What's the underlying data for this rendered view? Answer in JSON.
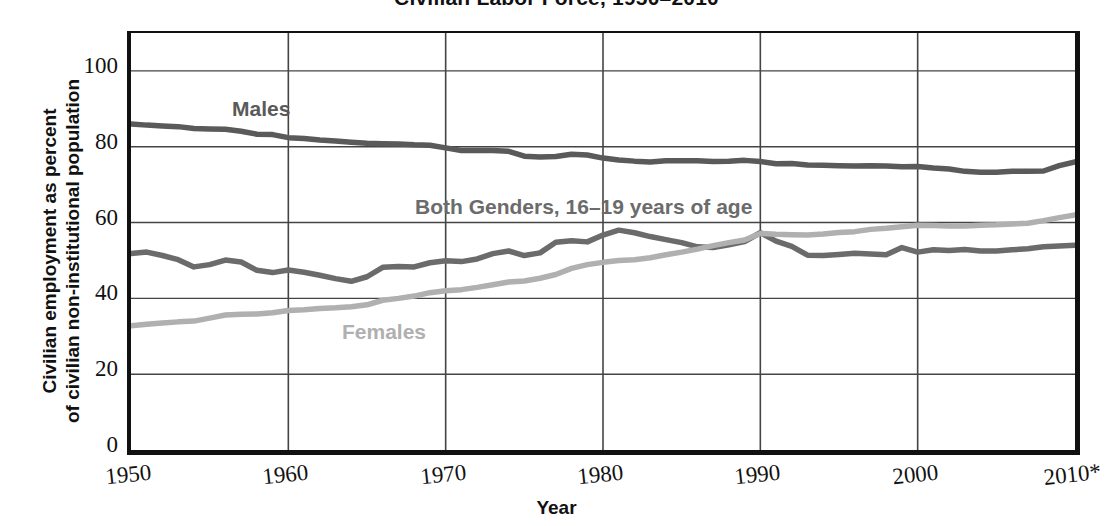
{
  "chart_data": {
    "type": "line",
    "title": "Civilian Labor Force, 1950–2010",
    "xlabel": "Year",
    "ylabel_line1": "Civilian employment as percent",
    "ylabel_line2": "of civilian non-institutional population",
    "xlim": [
      1950,
      2010
    ],
    "ylim": [
      0,
      110
    ],
    "yticks": [
      0,
      20,
      40,
      60,
      80,
      100
    ],
    "ytick_labels": [
      "0",
      "20",
      "40",
      "60",
      "80",
      "100"
    ],
    "xticks": [
      1950,
      1960,
      1970,
      1980,
      1990,
      2000,
      2010
    ],
    "xtick_labels": [
      "1950",
      "1960",
      "1970",
      "1980",
      "1990",
      "2000",
      "2010*"
    ],
    "grid": "both",
    "legend_position": "inline-annotations",
    "colors": {
      "males": "#5a5a5a",
      "both_genders_16_19": "#6b6b6b",
      "females": "#b0b0b0",
      "axis": "#111111",
      "gridline": "#444444",
      "background": "#ffffff"
    },
    "annotations": [
      {
        "text": "Males",
        "series": "Males"
      },
      {
        "text": "Both Genders, 16–19 years of age",
        "series": "Both Genders, 16-19 years of age"
      },
      {
        "text": "Females",
        "series": "Females"
      }
    ],
    "footnote_marker": "*",
    "x": [
      1950,
      1951,
      1952,
      1953,
      1954,
      1955,
      1956,
      1957,
      1958,
      1959,
      1960,
      1961,
      1962,
      1963,
      1964,
      1965,
      1966,
      1967,
      1968,
      1969,
      1970,
      1971,
      1972,
      1973,
      1974,
      1975,
      1976,
      1977,
      1978,
      1979,
      1980,
      1981,
      1982,
      1983,
      1984,
      1985,
      1986,
      1987,
      1988,
      1989,
      1990,
      1991,
      1992,
      1993,
      1994,
      1995,
      1996,
      1997,
      1998,
      1999,
      2000,
      2001,
      2002,
      2003,
      2004,
      2005,
      2006,
      2007,
      2008,
      2009,
      2010
    ],
    "series": [
      {
        "name": "Males",
        "label": "Males",
        "color": "#5a5a5a",
        "values": [
          86.0,
          85.7,
          85.5,
          85.3,
          84.8,
          84.7,
          84.6,
          84.1,
          83.3,
          83.2,
          82.4,
          82.2,
          81.8,
          81.5,
          81.2,
          80.9,
          80.8,
          80.7,
          80.5,
          80.4,
          79.7,
          79.0,
          79.0,
          79.0,
          78.8,
          77.5,
          77.3,
          77.4,
          78.0,
          77.8,
          77.0,
          76.5,
          76.2,
          76.0,
          76.3,
          76.3,
          76.3,
          76.1,
          76.2,
          76.4,
          76.1,
          75.5,
          75.6,
          75.2,
          75.1,
          75.0,
          74.9,
          75.0,
          74.9,
          74.7,
          74.8,
          74.4,
          74.1,
          73.5,
          73.3,
          73.3,
          73.5,
          73.5,
          73.6,
          75.0,
          76.0
        ]
      },
      {
        "name": "Both Genders, 16-19 years of age",
        "label": "Both Genders, 16–19 years of age",
        "color": "#6b6b6b",
        "values": [
          51.8,
          52.2,
          51.3,
          50.2,
          48.3,
          48.9,
          50.1,
          49.6,
          47.4,
          46.8,
          47.5,
          46.9,
          46.1,
          45.2,
          44.5,
          45.7,
          48.2,
          48.4,
          48.3,
          49.4,
          49.9,
          49.7,
          50.4,
          51.8,
          52.5,
          51.3,
          52.0,
          54.8,
          55.2,
          54.9,
          56.7,
          58.0,
          57.3,
          56.3,
          55.5,
          54.7,
          53.6,
          53.4,
          54.1,
          55.0,
          57.3,
          55.1,
          53.7,
          51.4,
          51.3,
          51.6,
          51.9,
          51.7,
          51.5,
          53.4,
          52.2,
          52.8,
          52.6,
          52.9,
          52.5,
          52.5,
          52.8,
          53.1,
          53.6,
          53.8,
          54.0
        ]
      },
      {
        "name": "Females",
        "label": "Females",
        "color": "#b0b0b0",
        "values": [
          32.8,
          33.2,
          33.5,
          33.8,
          34.0,
          34.8,
          35.6,
          35.8,
          35.9,
          36.2,
          36.8,
          37.0,
          37.3,
          37.5,
          37.8,
          38.3,
          39.5,
          40.0,
          40.6,
          41.5,
          42.0,
          42.3,
          42.9,
          43.6,
          44.3,
          44.6,
          45.3,
          46.3,
          47.9,
          48.9,
          49.5,
          50.0,
          50.2,
          50.7,
          51.5,
          52.2,
          53.0,
          53.9,
          54.7,
          55.4,
          57.1,
          56.9,
          56.8,
          56.7,
          57.0,
          57.4,
          57.6,
          58.2,
          58.5,
          58.9,
          59.3,
          59.2,
          59.1,
          59.1,
          59.3,
          59.4,
          59.6,
          59.8,
          60.5,
          61.3,
          62.0
        ]
      }
    ]
  },
  "title": {
    "text": "Civilian Labor Force, 1950–2010"
  }
}
